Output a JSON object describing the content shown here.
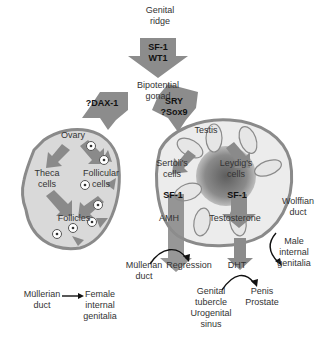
{
  "colors": {
    "arrow_gray": "#8c8c8c",
    "organ_fill": "#d9d9d9",
    "organ_border": "#8a8a8a",
    "testis_inner": "#7d7d7d",
    "tubule_fill": "#ececec",
    "text": "#333333"
  },
  "top": {
    "genital_ridge": [
      "Genital",
      "ridge"
    ],
    "arrow1_factors": [
      "SF-1",
      "WT1"
    ],
    "bipotential_gonad": [
      "Bipotential",
      "gonad"
    ]
  },
  "female_branch": {
    "factor": "?DAX-1",
    "organ": "Ovary",
    "theca_cells": [
      "Theca",
      "cells"
    ],
    "follicular_cells": [
      "Follicular",
      "cells"
    ],
    "follicles": "Follicles",
    "mullerian_duct": [
      "Müllerian",
      "duct"
    ],
    "female_internal_genitalia": [
      "Female",
      "internal",
      "genitalia"
    ]
  },
  "male_branch": {
    "factors": [
      "SRY",
      "?Sox9"
    ],
    "organ": "Testis",
    "sertoli_cells": [
      "Sertoli's",
      "cells"
    ],
    "leydig_cells": [
      "Leydig's",
      "cells"
    ],
    "sf1_left": "SF-1",
    "sf1_right": "SF-1",
    "amh": "AMH",
    "testosterone": "Testosterone",
    "mullerian_duct": [
      "Müllerian",
      "duct"
    ],
    "regression": "Regression",
    "dht": "DHT",
    "wolffian_duct": [
      "Wolffian",
      "duct"
    ],
    "male_internal_genitalia": [
      "Male",
      "internal",
      "genitalia"
    ],
    "genital_tubercle": [
      "Genital",
      "tubercle",
      "Urogenital",
      "sinus"
    ],
    "penis_prostate": [
      "Penis",
      "Prostate"
    ]
  }
}
